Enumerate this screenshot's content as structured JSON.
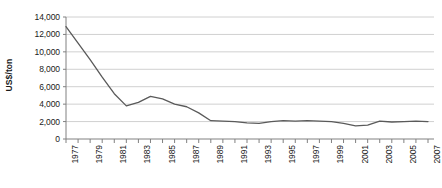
{
  "chart_data": {
    "type": "line",
    "title": "",
    "xlabel": "",
    "ylabel": "US$/ton",
    "ylim": [
      0,
      14000
    ],
    "ytick_values": [
      0,
      2000,
      4000,
      6000,
      8000,
      10000,
      12000,
      14000
    ],
    "ytick_labels": [
      "0",
      "2,000",
      "4,000",
      "6,000",
      "8,000",
      "10,000",
      "12,000",
      "14,000"
    ],
    "xlim": [
      1977,
      2007
    ],
    "xtick_labels": [
      "1977",
      "1979",
      "1981",
      "1983",
      "1985",
      "1987",
      "1989",
      "1991",
      "1993",
      "1995",
      "1997",
      "1999",
      "2001",
      "2003",
      "2005",
      "2007"
    ],
    "xtick_interval": 2,
    "xtick_minor_interval": 1,
    "grid": "horizontal",
    "legend": "none",
    "line_color": "#5a5a5a",
    "grid_color": "#d0d0d0",
    "axis_color": "#808080",
    "series": [
      {
        "name": "Price",
        "x": [
          1977,
          1978,
          1979,
          1980,
          1981,
          1982,
          1983,
          1984,
          1985,
          1986,
          1987,
          1988,
          1989,
          1990,
          1991,
          1992,
          1993,
          1994,
          1995,
          1996,
          1997,
          1998,
          1999,
          2000,
          2001,
          2002,
          2003,
          2004,
          2005,
          2006,
          2007
        ],
        "values": [
          12900,
          11000,
          9100,
          7100,
          5200,
          3800,
          4200,
          4900,
          4600,
          4000,
          3700,
          3000,
          2100,
          2050,
          2000,
          1850,
          1800,
          2000,
          2100,
          2050,
          2100,
          2050,
          2000,
          1800,
          1500,
          1600,
          2050,
          1950,
          2000,
          2050,
          2000
        ]
      }
    ]
  }
}
